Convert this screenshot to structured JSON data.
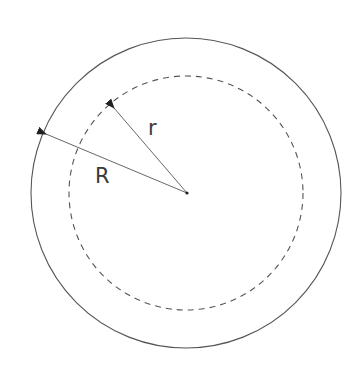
{
  "diagram": {
    "outer_circle": {
      "style": "solid",
      "label": "R"
    },
    "inner_circle": {
      "style": "dashed",
      "label": "r"
    },
    "labels": {
      "outer_radius": "R",
      "inner_radius": "r"
    },
    "colors": {
      "stroke": "#555555",
      "text": "#3a3a3a",
      "background": "#ffffff"
    }
  }
}
